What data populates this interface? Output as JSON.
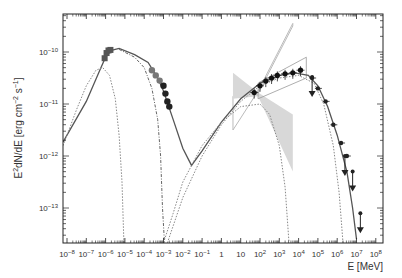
{
  "chart_data": {
    "type": "scatter",
    "title": "",
    "xlabel": "E [MeV]",
    "ylabel": "E²dN/dE [erg cm⁻² s⁻¹]",
    "xscale": "log",
    "yscale": "log",
    "xlim_log10": [
      -8.2,
      8.1
    ],
    "ylim_log10": [
      -13.67,
      -9.27
    ],
    "grid": false,
    "legend": null,
    "x_ticks": [
      "10^-8",
      "10^-7",
      "10^-6",
      "10^-5",
      "10^-4",
      "10^-3",
      "10^-2",
      "10^-1",
      "1",
      "10",
      "10^2",
      "10^3",
      "10^4",
      "10^5",
      "10^6",
      "10^7",
      "10^8"
    ],
    "y_ticks": [
      "10^-13",
      "10^-12",
      "10^-11",
      "10^-10"
    ],
    "series": [
      {
        "name": "total model",
        "style": "solid",
        "color": "#555555",
        "points_log10": [
          [
            -8.2,
            -11.73
          ],
          [
            -7,
            -10.95
          ],
          [
            -6.3,
            -10.35
          ],
          [
            -6,
            -10.1
          ],
          [
            -5.7,
            -9.97
          ],
          [
            -5.3,
            -9.93
          ],
          [
            -4.5,
            -10.05
          ],
          [
            -3.8,
            -10.2
          ],
          [
            -3.3,
            -10.5
          ],
          [
            -3,
            -10.75
          ],
          [
            -2.5,
            -11.3
          ],
          [
            -2,
            -11.85
          ],
          [
            -1.55,
            -12.18
          ],
          [
            -1,
            -11.9
          ],
          [
            0,
            -11.35
          ],
          [
            1,
            -10.9
          ],
          [
            2,
            -10.6
          ],
          [
            3,
            -10.45
          ],
          [
            3.8,
            -10.4
          ],
          [
            4.5,
            -10.45
          ],
          [
            5,
            -10.65
          ],
          [
            5.5,
            -11.05
          ],
          [
            6,
            -11.6
          ],
          [
            6.5,
            -12.3
          ],
          [
            6.8,
            -13.0
          ],
          [
            7,
            -13.6
          ]
        ]
      },
      {
        "name": "synchrotron component 1",
        "style": "dotted",
        "color": "#888888",
        "points_log10": [
          [
            -8.2,
            -11.8
          ],
          [
            -7.5,
            -11.1
          ],
          [
            -7,
            -10.65
          ],
          [
            -6.5,
            -10.35
          ],
          [
            -6.15,
            -10.3
          ],
          [
            -5.8,
            -10.45
          ],
          [
            -5.5,
            -10.9
          ],
          [
            -5.3,
            -11.6
          ],
          [
            -5.15,
            -12.5
          ],
          [
            -5.05,
            -13.67
          ]
        ]
      },
      {
        "name": "synchrotron component 2",
        "style": "dash-dot",
        "color": "#666666",
        "points_log10": [
          [
            -5.3,
            -9.95
          ],
          [
            -4.5,
            -10.1
          ],
          [
            -4,
            -10.3
          ],
          [
            -3.6,
            -10.7
          ],
          [
            -3.3,
            -11.3
          ],
          [
            -3.15,
            -12.0
          ],
          [
            -3.05,
            -13.0
          ],
          [
            -2.95,
            -13.67
          ]
        ]
      },
      {
        "name": "inverse Compton component 1",
        "style": "dotted",
        "color": "#888888",
        "points_log10": [
          [
            -3,
            -13.67
          ],
          [
            -2.5,
            -13.1
          ],
          [
            -2,
            -12.5
          ],
          [
            -1,
            -11.8
          ],
          [
            0,
            -11.35
          ],
          [
            1,
            -11.05
          ],
          [
            2,
            -11.0
          ],
          [
            2.5,
            -11.2
          ],
          [
            3,
            -11.8
          ],
          [
            3.3,
            -12.6
          ],
          [
            3.5,
            -13.67
          ]
        ]
      },
      {
        "name": "inverse Compton component 2",
        "style": "dotted",
        "color": "#888888",
        "points_log10": [
          [
            -2.8,
            -13.67
          ],
          [
            -2,
            -12.8
          ],
          [
            -1,
            -12.0
          ],
          [
            0,
            -11.4
          ],
          [
            1,
            -10.95
          ],
          [
            2,
            -10.65
          ],
          [
            3,
            -10.5
          ],
          [
            4,
            -10.45
          ],
          [
            4.8,
            -10.6
          ],
          [
            5.3,
            -11.0
          ],
          [
            5.8,
            -11.8
          ],
          [
            6.1,
            -12.7
          ],
          [
            6.3,
            -13.67
          ]
        ]
      }
    ],
    "data_points": {
      "optical_uv": [
        [
          -5.95,
          -10.02
        ],
        [
          -5.85,
          -9.97
        ],
        [
          -5.75,
          -9.96
        ],
        [
          -6.05,
          -10.12
        ]
      ],
      "xray": [
        [
          -3.6,
          -10.35
        ],
        [
          -3.4,
          -10.45
        ],
        [
          -3.2,
          -10.55
        ],
        [
          -3.0,
          -10.65
        ],
        [
          -2.9,
          -10.8
        ],
        [
          -2.8,
          -10.95
        ],
        [
          -2.7,
          -11.05
        ]
      ],
      "gamma_fermi": [
        [
          1.7,
          -10.78
        ],
        [
          2.0,
          -10.65
        ],
        [
          2.3,
          -10.56
        ],
        [
          2.6,
          -10.5
        ],
        [
          2.9,
          -10.45
        ],
        [
          3.3,
          -10.42
        ],
        [
          3.7,
          -10.4
        ],
        [
          4.1,
          -10.35
        ]
      ],
      "tev": [
        [
          4.7,
          -10.5
        ],
        [
          5.0,
          -10.7
        ],
        [
          5.4,
          -10.95
        ],
        [
          5.8,
          -11.4
        ],
        [
          6.2,
          -11.75
        ],
        [
          6.5,
          -12.0
        ]
      ],
      "upper_limits": [
        [
          4.7,
          -10.48
        ],
        [
          6.4,
          -12.0
        ],
        [
          6.8,
          -12.3
        ],
        [
          7.2,
          -13.1
        ]
      ]
    },
    "butterflies": [
      {
        "name": "gray outline bow-tie",
        "color": "#bbbbbb",
        "fill": "none"
      },
      {
        "name": "gray filled bow-tie",
        "color": "#cccccc",
        "fill": "#d8d8d8"
      }
    ]
  }
}
